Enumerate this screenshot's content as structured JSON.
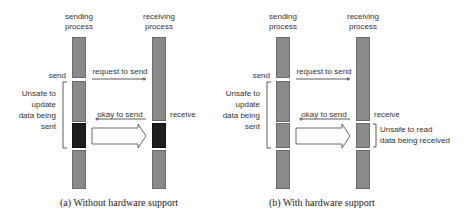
{
  "panels": [
    {
      "id": "a",
      "sending_process_label": "sending\nprocess",
      "receiving_process_label": "receiving\nprocess",
      "send_label": "send",
      "receive_label": "receive",
      "request_label": "request to send",
      "okay_label": "okay to send",
      "data_label": "data",
      "unsafe_update_label": "Unsafe to\nupdate\ndata being\nsent",
      "caption": "(a) Without hardware support",
      "buffer_shaded": true
    },
    {
      "id": "b",
      "sending_process_label": "sending\nprocess",
      "receiving_process_label": "receiving\nprocess",
      "send_label": "send",
      "receive_label": "receive",
      "request_label": "request to send",
      "okay_label": "okay to send",
      "data_label": "data",
      "unsafe_update_label": "Unsafe to\nupdate\ndata being\nsent",
      "unsafe_read_label": "Unsafe to read\ndata being received",
      "caption": "(b) With hardware support",
      "buffer_shaded": false
    }
  ],
  "colors": {
    "bar": "#8a8a8a",
    "bar_dark": "#1e1e1e",
    "text": "#333333"
  }
}
